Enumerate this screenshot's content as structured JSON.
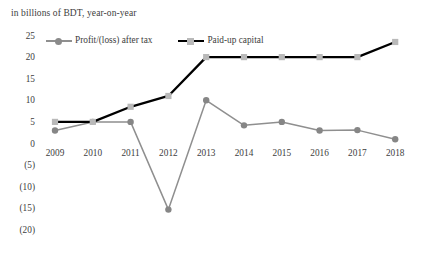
{
  "subtitle": "in billions of BDT, year-on-year",
  "legend": {
    "items": [
      {
        "label": "Profit/(loss) after tax",
        "color": "#8f8f8f",
        "marker": "circle"
      },
      {
        "label": "Paid-up capital",
        "color": "#000000",
        "marker": "square"
      }
    ]
  },
  "axis": {
    "y_ticks": [
      "25",
      "20",
      "15",
      "10",
      "5",
      "0",
      "(5)",
      "(10)",
      "(15)",
      "(20)"
    ],
    "x_ticks": [
      "2009",
      "2010",
      "2011",
      "2012",
      "2013",
      "2014",
      "2015",
      "2016",
      "2017",
      "2018"
    ]
  },
  "chart_data": {
    "type": "line",
    "title": "",
    "subtitle": "in billions of BDT, year-on-year",
    "xlabel": "",
    "ylabel": "",
    "ylim": [
      -20,
      25
    ],
    "ytick_step": 5,
    "ytick_values": [
      25,
      20,
      15,
      10,
      5,
      0,
      -5,
      -10,
      -15,
      -20
    ],
    "ytick_labels": [
      "25",
      "20",
      "15",
      "10",
      "5",
      "0",
      "(5)",
      "(10)",
      "(15)",
      "(20)"
    ],
    "grid": false,
    "legend_position": "top-left",
    "categories": [
      "2009",
      "2010",
      "2011",
      "2012",
      "2013",
      "2014",
      "2015",
      "2016",
      "2017",
      "2018"
    ],
    "series": [
      {
        "name": "Profit/(loss) after tax",
        "color": "#8f8f8f",
        "marker": "circle",
        "marker_color": "#868686",
        "values": [
          3.0,
          5.0,
          5.0,
          -15.3,
          10.0,
          4.2,
          5.0,
          3.0,
          3.1,
          1.0
        ]
      },
      {
        "name": "Paid-up capital",
        "color": "#000000",
        "marker": "square",
        "marker_color": "#b9b9b9",
        "values": [
          5.0,
          5.0,
          8.5,
          11.0,
          20.0,
          20.0,
          20.0,
          20.0,
          20.0,
          23.5
        ]
      }
    ]
  }
}
